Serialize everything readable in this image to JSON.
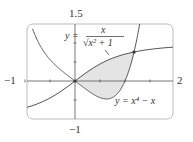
{
  "chart_data": {
    "type": "line",
    "title": "",
    "xlabel": "",
    "ylabel": "",
    "xlim": [
      -1,
      2
    ],
    "ylim": [
      -1,
      1.5
    ],
    "grid": false,
    "tick_labels": {
      "x_left": "−1",
      "x_right": "2",
      "y_top": "1.5",
      "y_bottom": "−1"
    },
    "series": [
      {
        "name": "y = x/√(x²+1)",
        "function": "x/sqrt(x^2+1)"
      },
      {
        "name": "y = x⁴ − x",
        "function": "x^4-x"
      }
    ],
    "shaded_region": {
      "between": [
        "y = x/√(x²+1)",
        "y = x⁴ − x"
      ],
      "x_range": [
        0,
        1.18
      ]
    },
    "intersections": [
      [
        0,
        0
      ],
      [
        1.18,
        0.76
      ]
    ],
    "annotations": [
      {
        "text": "y = x/√(x²+1)",
        "position": "top-center"
      },
      {
        "text": "y = x⁴ − x",
        "position": "bottom-right"
      }
    ]
  },
  "labels": {
    "y_top": "1.5",
    "y_bottom": "−1",
    "x_left": "−1",
    "x_right": "2",
    "eq1_lhs": "y =",
    "eq1_num": "x",
    "eq1_den": "√x² + 1",
    "eq2": "y = x⁴ − x"
  }
}
